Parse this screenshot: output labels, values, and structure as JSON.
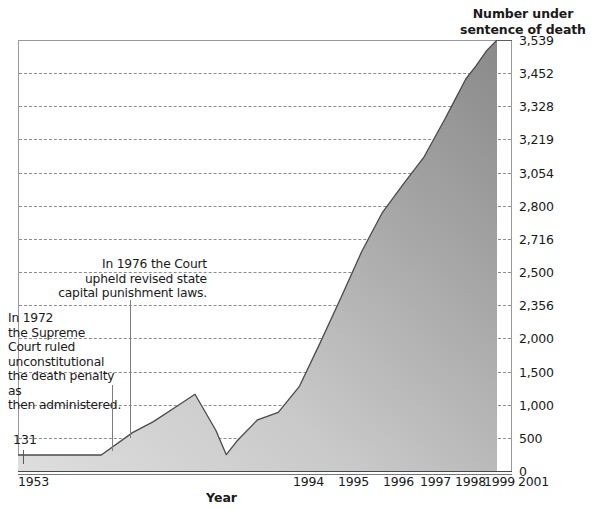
{
  "chart_data": {
    "type": "area",
    "xlabel": "Year",
    "ylabel": "Number under sentence of death",
    "grid": true,
    "legend": "none",
    "xlim": [
      1953,
      2001
    ],
    "ylim": [
      0,
      3539
    ],
    "y_tick_labels": [
      "3,539",
      "3,452",
      "3,328",
      "3,219",
      "3,054",
      "2,800",
      "2,716",
      "2,500",
      "2,356",
      "2,000",
      "1,500",
      "1,000",
      "500",
      "0"
    ],
    "x_tick_labels": [
      "1953",
      "1994",
      "1995",
      "1996",
      "1997",
      "1998",
      "1999",
      "2001"
    ],
    "first_value_label": "131",
    "x": [
      1953,
      1957,
      1961,
      1964,
      1966,
      1968,
      1970,
      1972,
      1973,
      1974,
      1976,
      1978,
      1980,
      1982,
      1984,
      1986,
      1988,
      1990,
      1992,
      1994,
      1995,
      1996,
      1997,
      1998,
      1999,
      2001
    ],
    "values": [
      131,
      131,
      131,
      315,
      406,
      517,
      631,
      334,
      134,
      244,
      420,
      482,
      692,
      1050,
      1420,
      1800,
      2124,
      2356,
      2580,
      2890,
      3054,
      3219,
      3328,
      3452,
      3539,
      3539
    ],
    "annotations": [
      {
        "name": "annotation-1976",
        "text": "In 1976 the Court upheld revised state capital punishment laws.",
        "lines": [
          "In 1976 the Court",
          "upheld revised state",
          "capital punishment laws."
        ],
        "points_to_year": 1976
      },
      {
        "name": "annotation-1972",
        "text": "In 1972 the Supreme Court ruled unconstitutional the death penalty as then administered.",
        "lines": [
          "In 1972",
          "the Supreme",
          "Court ruled",
          "unconstitutional",
          "the death penalty as",
          "then administered."
        ],
        "points_to_year": 1972
      }
    ],
    "colors": {
      "area_light": "#d9d9d9",
      "area_dark": "#8d8d8d",
      "outline": "#4a4a4a",
      "gridline": "#8d8d8d",
      "text": "#1a1a1a"
    }
  }
}
